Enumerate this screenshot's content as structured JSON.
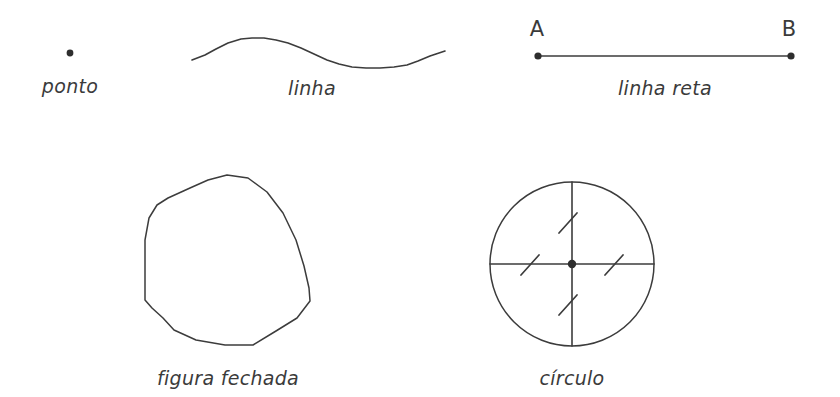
{
  "page": {
    "background_color": "#ffffff",
    "ink_color": "#3c3c3c",
    "width": 840,
    "height": 397
  },
  "figures": {
    "ponto": {
      "label": "ponto",
      "label_x": 70,
      "label_y": 93,
      "dot": {
        "cx": 70,
        "cy": 53,
        "r": 3.4
      }
    },
    "linha": {
      "label": "linha",
      "label_x": 312,
      "label_y": 95,
      "path_points": "192,60 205,55 216,49 228,43 241,39 252,38 264,38 276,40 288,43 301,48 314,54 327,60 339,64 352,67 366,68 380,68 394,67 407,65 418,61 430,56 445,51"
    },
    "linha_reta": {
      "label": "linha reta",
      "label_x": 665,
      "label_y": 95,
      "endpoint_a_label": "A",
      "endpoint_a_label_x": 537,
      "endpoint_a_label_y": 36,
      "endpoint_b_label": "B",
      "endpoint_b_label_x": 789,
      "endpoint_b_label_y": 36,
      "segment": {
        "x1": 538,
        "y1": 56,
        "x2": 791,
        "y2": 56
      },
      "dot_a": {
        "cx": 538,
        "cy": 56,
        "r": 3.6
      },
      "dot_b": {
        "cx": 791,
        "cy": 56,
        "r": 3.6
      }
    },
    "figura_fechada": {
      "label": "figura fechada",
      "label_x": 228,
      "label_y": 385,
      "polygon_points": "227,175 248,178 267,192 283,213 296,240 304,266 309,288 310,301 297,318 276,331 253,345 225,345 196,340 174,330 163,318 152,308 145,300 145,272 145,240 149,218 157,205 168,198 190,188 208,180"
    },
    "circulo": {
      "label": "círculo",
      "label_x": 572,
      "label_y": 385,
      "circle": {
        "cx": 572,
        "cy": 264,
        "r": 82
      },
      "center_dot": {
        "cx": 572,
        "cy": 264,
        "r": 4.2
      },
      "horizontal_diameter": {
        "x1": 490,
        "y1": 264,
        "x2": 654,
        "y2": 264
      },
      "vertical_diameter": {
        "x1": 572,
        "y1": 182,
        "x2": 572,
        "y2": 346
      },
      "radius_ticks": [
        {
          "name": "tick-up",
          "x1": 559,
          "y1": 233,
          "x2": 577,
          "y2": 213
        },
        {
          "name": "tick-right",
          "x1": 605,
          "y1": 275,
          "x2": 623,
          "y2": 255
        },
        {
          "name": "tick-down",
          "x1": 559,
          "y1": 315,
          "x2": 577,
          "y2": 295
        },
        {
          "name": "tick-left",
          "x1": 521,
          "y1": 275,
          "x2": 539,
          "y2": 255
        }
      ]
    }
  }
}
